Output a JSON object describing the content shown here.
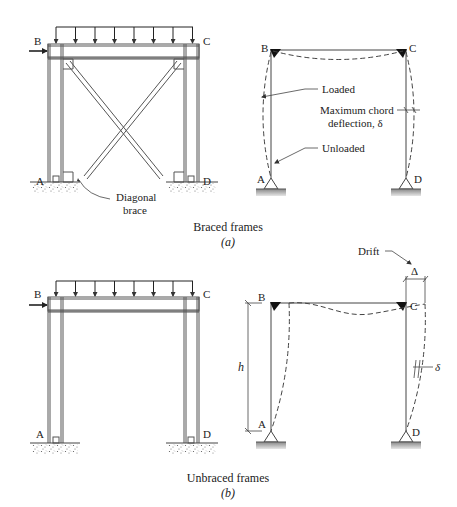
{
  "figure": {
    "panel_a": {
      "caption": "Braced frames",
      "sublabel": "(a)",
      "physical_frame": {
        "joint_labels": {
          "top_left": "B",
          "top_right": "C",
          "bottom_left": "A",
          "bottom_right": "D"
        },
        "annotation": {
          "line1": "Diagonal",
          "line2": "brace"
        },
        "load_arrow_count": 8,
        "lateral_load": true
      },
      "schematic": {
        "joint_labels": {
          "top_left": "B",
          "top_right": "C",
          "bottom_left": "A",
          "bottom_right": "D"
        },
        "annotations": {
          "loaded": "Loaded",
          "deflection_line1": "Maximum chord",
          "deflection_line2": "deflection, δ",
          "unloaded": "Unloaded"
        }
      }
    },
    "panel_b": {
      "caption": "Unbraced frames",
      "sublabel": "(b)",
      "physical_frame": {
        "joint_labels": {
          "top_left": "B",
          "top_right": "C",
          "bottom_left": "A",
          "bottom_right": "D"
        },
        "load_arrow_count": 8,
        "lateral_load": true
      },
      "schematic": {
        "joint_labels": {
          "top_left": "B",
          "top_right": "C",
          "bottom_left": "A",
          "bottom_right": "D"
        },
        "annotations": {
          "drift": "Drift",
          "drift_symbol": "Δ",
          "height_symbol": "h",
          "chord_symbol": "δ"
        }
      }
    }
  }
}
